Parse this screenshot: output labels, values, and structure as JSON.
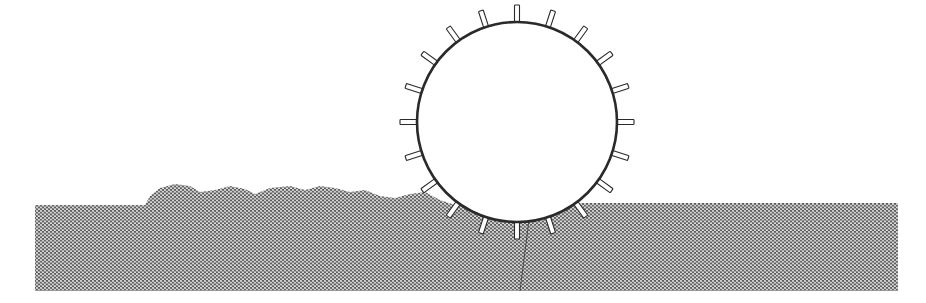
{
  "figure": {
    "background": "#ffffff",
    "wheel": {
      "cx": 517,
      "cy": 122,
      "r": 100,
      "stroke": "#2a2a2a",
      "fill": "#ffffff",
      "lug_count": 20,
      "lug_length": 17,
      "lug_width": 5,
      "lug_start_angle_deg": -90
    },
    "ground": {
      "x_left": 35,
      "x_right": 898,
      "y_bottom": 291,
      "y_top_left": 205,
      "y_top_right": 203,
      "particle_color": "#6a6a6a",
      "particle_light": "#dcdcdc",
      "particle_spacing": 4
    },
    "pile_profile": [
      [
        145,
        205
      ],
      [
        150,
        196
      ],
      [
        160,
        188
      ],
      [
        175,
        184
      ],
      [
        190,
        186
      ],
      [
        200,
        192
      ],
      [
        215,
        190
      ],
      [
        230,
        186
      ],
      [
        245,
        189
      ],
      [
        255,
        194
      ],
      [
        270,
        188
      ],
      [
        290,
        186
      ],
      [
        305,
        190
      ],
      [
        320,
        186
      ],
      [
        335,
        188
      ],
      [
        350,
        192
      ],
      [
        365,
        190
      ],
      [
        380,
        196
      ],
      [
        395,
        198
      ],
      [
        410,
        194
      ],
      [
        425,
        192
      ],
      [
        440,
        200
      ]
    ],
    "crack": [
      [
        530,
        212
      ],
      [
        520,
        291
      ]
    ]
  }
}
